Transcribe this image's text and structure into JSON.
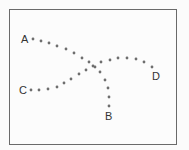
{
  "diagram": {
    "labels": [
      {
        "text": "A",
        "x": 21,
        "y": 43
      },
      {
        "text": "B",
        "x": 105,
        "y": 120
      },
      {
        "text": "C",
        "x": 19,
        "y": 94
      },
      {
        "text": "D",
        "x": 152,
        "y": 80
      }
    ],
    "paths": [
      {
        "name": "path-a-to-b",
        "from": "A",
        "to": "B",
        "dots": [
          [
            33,
            39
          ],
          [
            41,
            41
          ],
          [
            49,
            43
          ],
          [
            57,
            46
          ],
          [
            66,
            49
          ],
          [
            74,
            53
          ],
          [
            82,
            58
          ],
          [
            89,
            62
          ],
          [
            95,
            67
          ],
          [
            100,
            72
          ],
          [
            105,
            80
          ],
          [
            108,
            88
          ],
          [
            109,
            97
          ],
          [
            109,
            106
          ]
        ]
      },
      {
        "name": "path-c-to-d",
        "from": "C",
        "to": "D",
        "dots": [
          [
            31,
            90
          ],
          [
            39,
            90
          ],
          [
            48,
            89
          ],
          [
            57,
            87
          ],
          [
            64,
            83
          ],
          [
            71,
            79
          ],
          [
            79,
            74
          ],
          [
            86,
            70
          ],
          [
            93,
            66
          ],
          [
            101,
            62
          ],
          [
            110,
            60
          ],
          [
            118,
            58
          ],
          [
            127,
            58
          ],
          [
            136,
            59
          ],
          [
            144,
            62
          ],
          [
            152,
            67
          ]
        ]
      }
    ],
    "dot_color": "#6e6e6e"
  }
}
